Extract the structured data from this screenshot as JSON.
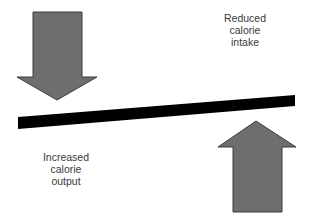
{
  "diagram": {
    "type": "energy-balance-seesaw",
    "colors": {
      "arrow_fill": "#6e6e6e",
      "arrow_stroke": "#3c3c3c",
      "beam": "#000000",
      "text": "#3a3a3a",
      "background": "#ffffff"
    },
    "down_arrow": {
      "direction": "down",
      "position": "top-left"
    },
    "up_arrow": {
      "direction": "up",
      "position": "bottom-right"
    },
    "beam": {
      "orientation": "tilted, rising to the right"
    },
    "labels": {
      "intake": {
        "line1": "Reduced",
        "line2": "calorie",
        "line3": "intake"
      },
      "output": {
        "line1": "Increased",
        "line2": "calorie",
        "line3": "output"
      }
    }
  }
}
